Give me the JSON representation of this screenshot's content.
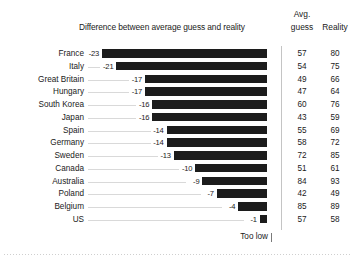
{
  "header": {
    "title": "Difference between average guess and reality",
    "col_avg": "Avg.",
    "col_guess": "guess",
    "col_reality": "Reality"
  },
  "footer": {
    "note": "Too low"
  },
  "chart_data": {
    "type": "bar",
    "title": "Difference between average guess and reality",
    "orientation": "horizontal",
    "xlabel": "",
    "ylabel": "",
    "xlim": [
      -25,
      0
    ],
    "grid": false,
    "legend": null,
    "annotations": [
      "Too low"
    ],
    "categories": [
      "France",
      "Italy",
      "Great Britain",
      "Hungary",
      "South Korea",
      "Japan",
      "Spain",
      "Germany",
      "Sweden",
      "Canada",
      "Australia",
      "Poland",
      "Belgium",
      "US"
    ],
    "values": [
      -23,
      -21,
      -17,
      -17,
      -16,
      -16,
      -14,
      -14,
      -13,
      -10,
      -9,
      -7,
      -4,
      -1
    ],
    "value_labels": [
      "-23",
      "-21",
      "-17",
      "-17",
      "-16",
      "-16",
      "-14",
      "-14",
      "-13",
      "-10",
      "-9",
      "-7",
      "-4",
      "-1"
    ],
    "series": [
      {
        "name": "Difference between average guess and reality",
        "values": [
          -23,
          -21,
          -17,
          -17,
          -16,
          -16,
          -14,
          -14,
          -13,
          -10,
          -9,
          -7,
          -4,
          -1
        ]
      },
      {
        "name": "Avg. guess",
        "values": [
          57,
          54,
          49,
          47,
          60,
          43,
          55,
          58,
          72,
          51,
          84,
          42,
          85,
          57
        ]
      },
      {
        "name": "Reality",
        "values": [
          80,
          75,
          66,
          64,
          76,
          59,
          69,
          72,
          85,
          61,
          93,
          49,
          89,
          58
        ]
      }
    ],
    "rows": [
      {
        "country": "France",
        "diff": "-23",
        "guess": "57",
        "reality": "80"
      },
      {
        "country": "Italy",
        "diff": "-21",
        "guess": "54",
        "reality": "75"
      },
      {
        "country": "Great Britain",
        "diff": "-17",
        "guess": "49",
        "reality": "66"
      },
      {
        "country": "Hungary",
        "diff": "-17",
        "guess": "47",
        "reality": "64"
      },
      {
        "country": "South Korea",
        "diff": "-16",
        "guess": "60",
        "reality": "76"
      },
      {
        "country": "Japan",
        "diff": "-16",
        "guess": "43",
        "reality": "59"
      },
      {
        "country": "Spain",
        "diff": "-14",
        "guess": "55",
        "reality": "69"
      },
      {
        "country": "Germany",
        "diff": "-14",
        "guess": "58",
        "reality": "72"
      },
      {
        "country": "Sweden",
        "diff": "-13",
        "guess": "72",
        "reality": "85"
      },
      {
        "country": "Canada",
        "diff": "-10",
        "guess": "51",
        "reality": "61"
      },
      {
        "country": "Australia",
        "diff": "-9",
        "guess": "84",
        "reality": "93"
      },
      {
        "country": "Poland",
        "diff": "-7",
        "guess": "42",
        "reality": "49"
      },
      {
        "country": "Belgium",
        "diff": "-4",
        "guess": "85",
        "reality": "89"
      },
      {
        "country": "US",
        "diff": "-1",
        "guess": "57",
        "reality": "58"
      }
    ],
    "colors": {
      "bar": "#1c1c1c",
      "leader": "#d9d9d9",
      "axis": "#c4c4c4",
      "text": "#1a1a1a",
      "background": "#ffffff"
    }
  }
}
